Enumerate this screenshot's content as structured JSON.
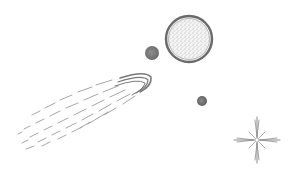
{
  "scene": {
    "description": "Pencil-sketch illustration of space: a comet, a large speckled planet, two small moons, and a sparkling star",
    "background": "#ffffff",
    "ink_color": "#6e6e6e",
    "elements": [
      {
        "name": "comet",
        "head": [
          150,
          80
        ],
        "tail_end": [
          20,
          148
        ]
      },
      {
        "name": "large-planet",
        "center": [
          189,
          39
        ],
        "radius": 23
      },
      {
        "name": "small-moon",
        "center": [
          152,
          53
        ],
        "radius": 7
      },
      {
        "name": "tiny-moon",
        "center": [
          202,
          101
        ],
        "radius": 5
      },
      {
        "name": "sparkle-star",
        "center": [
          257,
          140
        ],
        "size": 22
      }
    ]
  }
}
